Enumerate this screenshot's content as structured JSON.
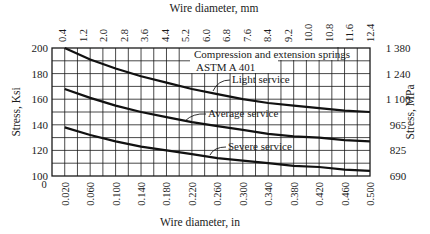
{
  "chart_data": {
    "type": "line",
    "title": "Compression and extension springs ASTM A 401",
    "annotation_lines": [
      "Compression and extension springs",
      "ASTM A 401"
    ],
    "xlabel": "Wire diameter, in",
    "x2label": "Wire diameter, mm",
    "ylabel": "Stress, Ksi",
    "y2label": "Stress, MPa",
    "xlim": [
      0,
      0.5
    ],
    "ylim": [
      100,
      200
    ],
    "grid": true,
    "x_tick_labels": [
      "0",
      "0.020",
      "0.060",
      "0.100",
      "0.140",
      "0.180",
      "0.220",
      "0.260",
      "0.300",
      "0.340",
      "0.380",
      "0.420",
      "0.460",
      "0.500"
    ],
    "x2_tick_labels": [
      "0.4",
      "1.2",
      "2.0",
      "2.8",
      "3.6",
      "4.4",
      "5.2",
      "6.0",
      "6.8",
      "7.6",
      "8.4",
      "9.2",
      "10.0",
      "10.8",
      "11.6",
      "12.4"
    ],
    "y_tick_labels": [
      "100",
      "120",
      "140",
      "160",
      "180",
      "200"
    ],
    "y2_tick_labels": [
      "690",
      "825",
      "965",
      "1 100",
      "1 240",
      "1 380"
    ],
    "x": [
      0.02,
      0.06,
      0.1,
      0.14,
      0.18,
      0.22,
      0.26,
      0.3,
      0.34,
      0.38,
      0.42,
      0.46,
      0.5
    ],
    "series": [
      {
        "name": "Light service",
        "values": [
          200,
          191,
          184,
          178,
          173,
          168,
          164,
          160,
          157,
          155,
          153,
          151,
          150
        ]
      },
      {
        "name": "Average service",
        "values": [
          168,
          161,
          155,
          150,
          146,
          142,
          139,
          136,
          133,
          131,
          130,
          128,
          127
        ]
      },
      {
        "name": "Severe service",
        "values": [
          138,
          132,
          127,
          123,
          120,
          117,
          114,
          112,
          110,
          108,
          107,
          105,
          104
        ]
      }
    ]
  }
}
